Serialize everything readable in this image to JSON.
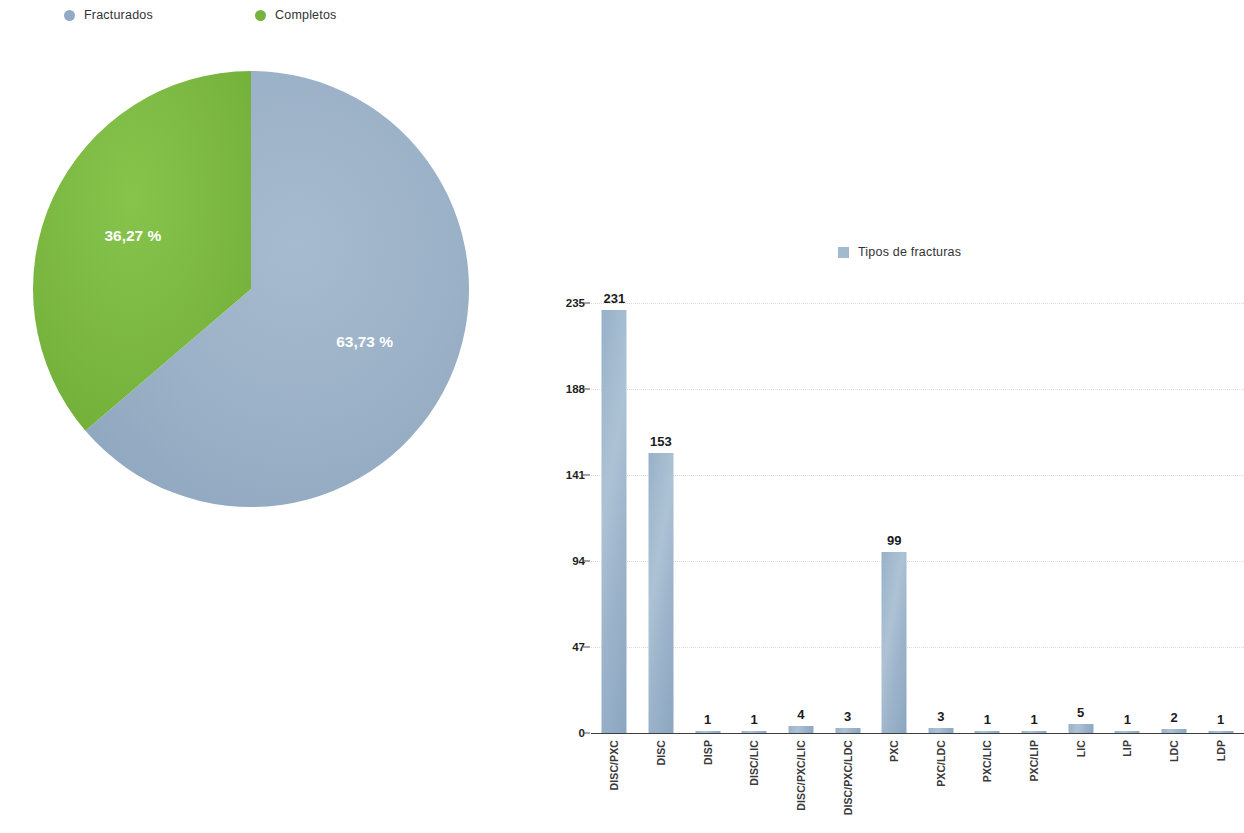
{
  "pie_chart": {
    "legend": [
      {
        "label": "Fracturados",
        "color": "#93aac4",
        "marker": "circle"
      },
      {
        "label": "Completos",
        "color": "#76b43f",
        "marker": "circle"
      }
    ],
    "slices": [
      {
        "label": "Fracturados",
        "value_label": "63,73 %",
        "percent": 63.73,
        "color": "#9bb1c7"
      },
      {
        "label": "Completos",
        "value_label": "36,27 %",
        "percent": 36.27,
        "color": "#7cb841"
      }
    ]
  },
  "bar_chart": {
    "legend": [
      {
        "label": "Tipos de fracturas",
        "color": "#a3b9cf",
        "marker": "square"
      }
    ]
  },
  "chart_data": [
    {
      "type": "pie",
      "title": "",
      "categories": [
        "Fracturados",
        "Completos"
      ],
      "values": [
        63.73,
        36.27
      ],
      "value_labels": [
        "63,73 %",
        "36,27 %"
      ],
      "colors": [
        "#9bb1c7",
        "#7cb841"
      ],
      "legend": [
        "Fracturados",
        "Completos"
      ],
      "legend_position": "top",
      "units": "percent"
    },
    {
      "type": "bar",
      "title": "",
      "legend": [
        "Tipos de fracturas"
      ],
      "legend_position": "top",
      "xlabel": "",
      "ylabel": "",
      "ylim": [
        0,
        235
      ],
      "yticks": [
        0,
        47,
        94,
        141,
        188,
        235
      ],
      "ytick_labels": [
        "0",
        "47",
        "94",
        "141",
        "188",
        "235"
      ],
      "grid": true,
      "bar_color": "#a3b9cf",
      "categories": [
        "DISC/PXC",
        "DISC",
        "DISP",
        "DISC/LIC",
        "DISC/PXC/LIC",
        "DISC/PXC/LDC",
        "PXC",
        "PXC/LDC",
        "PXC/LIC",
        "PXC/LIP",
        "LIC",
        "LIP",
        "LDC",
        "LDP"
      ],
      "values": [
        231,
        153,
        1,
        1,
        4,
        3,
        99,
        3,
        1,
        1,
        5,
        1,
        2,
        1
      ],
      "data_labels": [
        "231",
        "153",
        "1",
        "1",
        "4",
        "3",
        "99",
        "3",
        "1",
        "1",
        "5",
        "1",
        "2",
        "1"
      ]
    }
  ]
}
